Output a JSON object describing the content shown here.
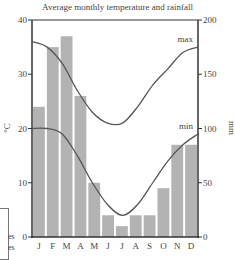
{
  "chart_data": {
    "type": "bar+line",
    "title": "Average monthly temperature and rainfall",
    "categories": [
      "J",
      "F",
      "M",
      "A",
      "M",
      "J",
      "J",
      "A",
      "S",
      "O",
      "N",
      "D"
    ],
    "left_axis": {
      "label": "°C",
      "ticks": [
        0,
        10,
        20,
        30,
        40
      ],
      "range": [
        0,
        40
      ]
    },
    "right_axis": {
      "label": "mm",
      "ticks": [
        0,
        50,
        100,
        150,
        200
      ],
      "range": [
        0,
        200
      ]
    },
    "series": [
      {
        "name": "rainfall",
        "type": "bar",
        "axis": "right",
        "unit": "mm",
        "values": [
          120,
          175,
          185,
          130,
          50,
          20,
          10,
          20,
          20,
          45,
          85,
          85
        ]
      },
      {
        "name": "max",
        "type": "line",
        "axis": "left",
        "unit": "°C",
        "values": [
          36,
          35,
          32,
          27,
          23,
          21,
          21,
          24,
          28,
          31,
          34,
          35
        ]
      },
      {
        "name": "min",
        "type": "line",
        "axis": "left",
        "unit": "°C",
        "values": [
          20,
          20,
          19,
          15,
          10,
          6,
          4,
          6,
          10,
          14,
          17,
          19
        ]
      }
    ],
    "annotations": [
      "max",
      "min"
    ],
    "colors": {
      "bars": "#b3b3b3",
      "lines": "#555555",
      "axes": "#333333"
    }
  },
  "legend_fragment": {
    "line1": "es",
    "line2": "es"
  }
}
